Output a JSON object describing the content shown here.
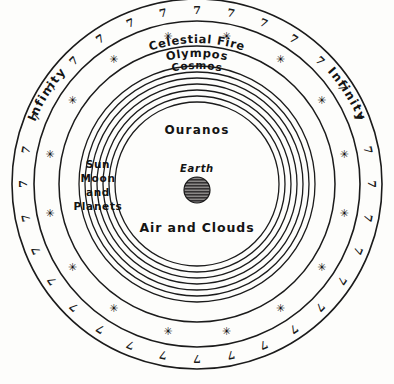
{
  "diagram": {
    "background_color": "#fdfdfb",
    "ink_color": "#1b1b1b",
    "center": {
      "x": 197,
      "y": 184
    }
  },
  "labels": {
    "infinity_left": "Infinity",
    "infinity_right": "Infinity",
    "celestial_fire": "Celestial Fire",
    "olympos": "Olympos",
    "cosmos": "Cosmos",
    "ouranos": "Ouranos",
    "sun_moon_planets_line1": "Sun",
    "sun_moon_planets_line2": "Moon",
    "sun_moon_planets_line3": "and",
    "sun_moon_planets_line4": "Planets",
    "earth": "Earth",
    "air_and_clouds": "Air and Clouds"
  },
  "spheres": [
    {
      "name": "celestial-fire-outer-edge",
      "radius": 185,
      "stroke_width": 1.6
    },
    {
      "name": "celestial-fire-inner-edge",
      "radius": 163,
      "stroke_width": 1.6
    },
    {
      "name": "olympos-outer-edge",
      "radius": 138,
      "stroke_width": 1.5
    },
    {
      "name": "cosmos-sphere-1",
      "radius": 118,
      "stroke_width": 1.3
    },
    {
      "name": "cosmos-sphere-2",
      "radius": 112,
      "stroke_width": 1.3
    },
    {
      "name": "cosmos-sphere-3",
      "radius": 106,
      "stroke_width": 1.3
    },
    {
      "name": "cosmos-sphere-4",
      "radius": 100,
      "stroke_width": 1.3
    },
    {
      "name": "cosmos-sphere-5",
      "radius": 94,
      "stroke_width": 1.3
    },
    {
      "name": "cosmos-sphere-6",
      "radius": 88,
      "stroke_width": 1.3
    },
    {
      "name": "cosmos-sphere-7",
      "radius": 82,
      "stroke_width": 1.3
    }
  ],
  "earth_body": {
    "radius": 13,
    "fill": "#2b2b2b",
    "hatched": true
  },
  "flames": {
    "glyph": "7",
    "count": 32,
    "band_radius": 174,
    "description": "stylized flame strokes around the Celestial Fire band"
  },
  "stars": {
    "glyph": "✳",
    "count": 16,
    "band_radius": 150,
    "description": "six-pointed star asterisks in the Olympos band"
  },
  "chart_data": {
    "type": "diagram",
    "scheme": "concentric-spheres",
    "layers_outward": [
      {
        "order": 1,
        "label": "Earth",
        "kind": "central-body"
      },
      {
        "order": 2,
        "label": "Air and Clouds",
        "kind": "region"
      },
      {
        "order": 3,
        "label": "Ouranos",
        "kind": "region"
      },
      {
        "order": 4,
        "label": "Sun Moon and Planets",
        "kind": "planetary-spheres",
        "sphere_count": 7
      },
      {
        "order": 5,
        "label": "Cosmos",
        "kind": "boundary"
      },
      {
        "order": 6,
        "label": "Olympos",
        "kind": "band",
        "contains": "stars"
      },
      {
        "order": 7,
        "label": "Celestial Fire",
        "kind": "band",
        "contains": "flames"
      },
      {
        "order": 8,
        "label": "Infinity",
        "kind": "outside-the-spheres"
      }
    ]
  }
}
